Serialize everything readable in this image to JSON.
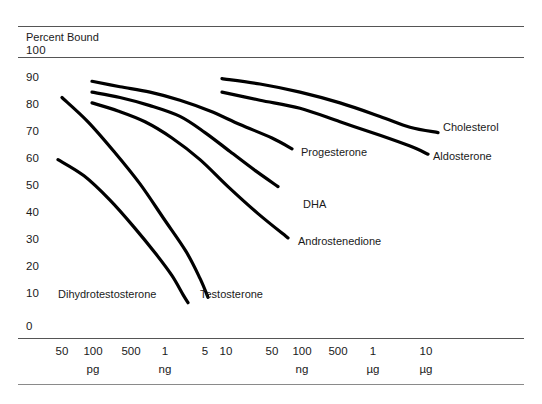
{
  "figure": {
    "axis_title": "Percent Bound",
    "y_ticks": [
      "100",
      "90",
      "80",
      "70",
      "60",
      "50",
      "40",
      "30",
      "20",
      "10",
      "0"
    ],
    "x_ticks": [
      "50",
      "100",
      "500",
      "1",
      "5",
      "10",
      "50",
      "100",
      "500",
      "1",
      "10"
    ],
    "x_units": [
      "pg",
      "ng",
      "ng",
      "µg",
      "µg"
    ],
    "curve_labels": {
      "cholesterol": "Cholesterol",
      "aldosterone": "Aldosterone",
      "progesterone": "Progesterone",
      "dha": "DHA",
      "androstenedione": "Androstenedione",
      "testosterone": "Testosterone",
      "dihydrotestosterone": "Dihydrotestosterone"
    }
  },
  "chart_data": {
    "type": "line",
    "title": "",
    "subtitle": "",
    "xlabel": "",
    "ylabel": "Percent Bound",
    "ylim": [
      0,
      100
    ],
    "grid": false,
    "legend": "inline-end-labels",
    "y_tick_values": [
      100,
      90,
      80,
      70,
      60,
      50,
      40,
      30,
      20,
      10,
      0
    ],
    "x_tick_labels": [
      "50",
      "100",
      "500",
      "1",
      "5",
      "10",
      "50",
      "100",
      "500",
      "1",
      "10"
    ],
    "x_tick_units": [
      "pg",
      "pg",
      "pg",
      "ng",
      "ng",
      "ng",
      "ng",
      "ng",
      "ng",
      "µg",
      "µg"
    ],
    "x_unit_row_labels": [
      {
        "label": "pg",
        "under_tick": "100"
      },
      {
        "label": "ng",
        "under_tick": "1"
      },
      {
        "label": "ng",
        "under_tick": "100"
      },
      {
        "label": "µg",
        "under_tick": "1"
      },
      {
        "label": "µg",
        "under_tick": "10"
      }
    ],
    "note": "Competitive binding displacement curves: percent bound vs. competitor mass on a log-like axis.",
    "series": [
      {
        "name": "Cholesterol",
        "points": [
          [
            222,
            92
          ],
          [
            260,
            90
          ],
          [
            300,
            87
          ],
          [
            340,
            83
          ],
          [
            380,
            78
          ],
          [
            410,
            74
          ],
          [
            438,
            72
          ]
        ]
      },
      {
        "name": "Aldosterone",
        "points": [
          [
            222,
            87
          ],
          [
            260,
            84
          ],
          [
            300,
            81
          ],
          [
            340,
            76
          ],
          [
            380,
            71
          ],
          [
            410,
            67
          ],
          [
            428,
            64
          ]
        ]
      },
      {
        "name": "Progesterone",
        "points": [
          [
            92,
            91
          ],
          [
            120,
            89
          ],
          [
            150,
            87
          ],
          [
            180,
            84
          ],
          [
            210,
            80
          ],
          [
            240,
            75
          ],
          [
            272,
            70
          ],
          [
            292,
            66
          ]
        ]
      },
      {
        "name": "DHA",
        "points": [
          [
            92,
            87
          ],
          [
            120,
            85
          ],
          [
            150,
            82
          ],
          [
            180,
            78
          ],
          [
            205,
            72
          ],
          [
            230,
            65
          ],
          [
            255,
            58
          ],
          [
            278,
            52
          ]
        ]
      },
      {
        "name": "Androstenedione",
        "points": [
          [
            92,
            83
          ],
          [
            118,
            80
          ],
          [
            145,
            76
          ],
          [
            172,
            70
          ],
          [
            200,
            62
          ],
          [
            228,
            52
          ],
          [
            258,
            42
          ],
          [
            288,
            33
          ]
        ]
      },
      {
        "name": "Testosterone",
        "points": [
          [
            62,
            85
          ],
          [
            88,
            76
          ],
          [
            114,
            65
          ],
          [
            140,
            53
          ],
          [
            164,
            40
          ],
          [
            186,
            28
          ],
          [
            200,
            18
          ],
          [
            208,
            11
          ]
        ]
      },
      {
        "name": "Dihydrotestosterone",
        "points": [
          [
            58,
            62
          ],
          [
            84,
            56
          ],
          [
            110,
            47
          ],
          [
            134,
            37
          ],
          [
            156,
            27
          ],
          [
            172,
            19
          ],
          [
            183,
            12
          ],
          [
            188,
            9
          ]
        ]
      }
    ]
  }
}
